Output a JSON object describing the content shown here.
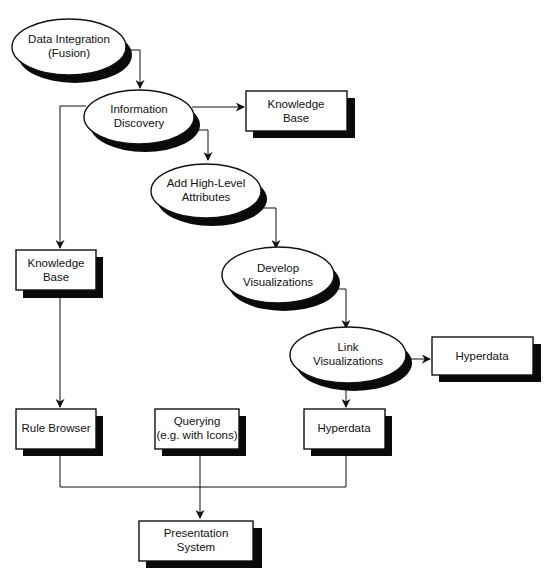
{
  "diagram": {
    "type": "flowchart",
    "nodes": {
      "data_integration": {
        "shape": "ellipse",
        "line1": "Data Integration",
        "line2": "(Fusion)"
      },
      "information_discovery": {
        "shape": "ellipse",
        "line1": "Information",
        "line2": "Discovery"
      },
      "knowledge_base_top": {
        "shape": "box",
        "line1": "Knowledge",
        "line2": "Base"
      },
      "add_high_level": {
        "shape": "ellipse",
        "line1": "Add High-Level",
        "line2": "Attributes"
      },
      "knowledge_base_left": {
        "shape": "box",
        "line1": "Knowledge",
        "line2": "Base"
      },
      "develop_vis": {
        "shape": "ellipse",
        "line1": "Develop",
        "line2": "Visualizations"
      },
      "link_vis": {
        "shape": "ellipse",
        "line1": "Link",
        "line2": "Visualizations"
      },
      "hyperdata_right": {
        "shape": "box",
        "line1": "Hyperdata"
      },
      "rule_browser": {
        "shape": "box",
        "line1": "Rule Browser"
      },
      "querying": {
        "shape": "box",
        "line1": "Querying",
        "line2": "(e.g. with Icons)"
      },
      "hyperdata_bottom": {
        "shape": "box",
        "line1": "Hyperdata"
      },
      "presentation": {
        "shape": "box",
        "line1": "Presentation",
        "line2": "System"
      }
    },
    "edges": [
      {
        "from": "Data Integration (Fusion)",
        "to": "Information Discovery"
      },
      {
        "from": "Information Discovery",
        "to": "Knowledge Base (top)"
      },
      {
        "from": "Information Discovery",
        "to": "Add High-Level Attributes"
      },
      {
        "from": "Information Discovery",
        "to": "Knowledge Base (left)"
      },
      {
        "from": "Add High-Level Attributes",
        "to": "Develop Visualizations"
      },
      {
        "from": "Develop Visualizations",
        "to": "Link Visualizations"
      },
      {
        "from": "Link Visualizations",
        "to": "Hyperdata (right)"
      },
      {
        "from": "Link Visualizations",
        "to": "Hyperdata (bottom)"
      },
      {
        "from": "Knowledge Base (left)",
        "to": "Rule Browser"
      },
      {
        "from": "Rule Browser",
        "to": "Presentation System"
      },
      {
        "from": "Querying (e.g. with Icons)",
        "to": "Presentation System"
      },
      {
        "from": "Hyperdata (bottom)",
        "to": "Presentation System"
      }
    ]
  }
}
